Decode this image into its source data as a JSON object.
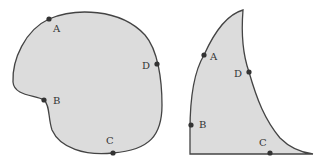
{
  "figures": [
    {
      "name": "rounded-shape",
      "fill": "#dcdcdc",
      "stroke": "#444444",
      "points": [
        {
          "label": "A",
          "dot": [
            49,
            19
          ],
          "text": [
            54,
            32
          ]
        },
        {
          "label": "D",
          "dot": [
            157,
            64
          ],
          "text": [
            142,
            69
          ]
        },
        {
          "label": "B",
          "dot": [
            44,
            100
          ],
          "text": [
            54,
            104
          ]
        },
        {
          "label": "C",
          "dot": [
            113,
            153
          ],
          "text": [
            107,
            144
          ]
        }
      ]
    },
    {
      "name": "tapered-shape",
      "fill": "#dcdcdc",
      "stroke": "#444444",
      "points": [
        {
          "label": "A",
          "dot": [
            204,
            55
          ],
          "text": [
            210,
            60
          ]
        },
        {
          "label": "D",
          "dot": [
            249,
            72
          ],
          "text": [
            235,
            77
          ]
        },
        {
          "label": "B",
          "dot": [
            191,
            125
          ],
          "text": [
            199,
            127
          ]
        },
        {
          "label": "C",
          "dot": [
            270,
            153
          ],
          "text": [
            260,
            146
          ]
        }
      ]
    }
  ]
}
